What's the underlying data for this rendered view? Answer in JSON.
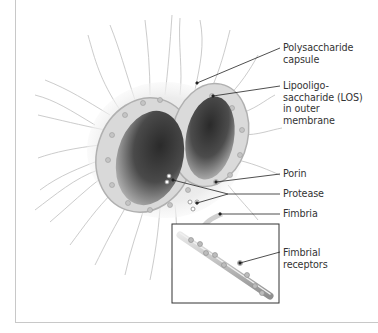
{
  "figure": {
    "labels": {
      "capsule": {
        "lines": [
          "Polysaccharide",
          "capsule"
        ]
      },
      "los": {
        "lines": [
          "Lipooligo-",
          "saccharide (LOS)",
          "in outer",
          "membrane"
        ]
      },
      "porin": {
        "lines": [
          "Porin"
        ]
      },
      "protease": {
        "lines": [
          "Protease"
        ]
      },
      "fimbria": {
        "lines": [
          "Fimbria"
        ]
      },
      "fimbrial_receptors": {
        "lines": [
          "Fimbrial",
          "receptors"
        ]
      }
    },
    "inset": {
      "name": "fimbria-closeup"
    },
    "colors": {
      "cell_dark": "#3a3a3a",
      "cell_mid": "#8a8a8a",
      "capsule": "#e6e6e6",
      "membrane": "#cfcfcf",
      "leader_line": "#222222",
      "text": "#333333",
      "frame": "#c8c8c8"
    }
  }
}
